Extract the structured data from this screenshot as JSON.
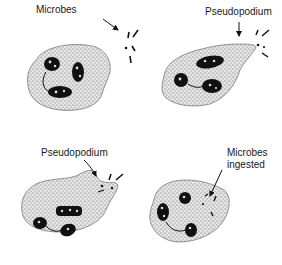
{
  "diagram": {
    "panels": [
      {
        "id": "stage-1",
        "label": "Microbes"
      },
      {
        "id": "stage-2",
        "label": "Pseudopodium"
      },
      {
        "id": "stage-3",
        "label": "Pseudopodium"
      },
      {
        "id": "stage-4",
        "label_line1": "Microbes",
        "label_line2": "ingested"
      }
    ]
  }
}
